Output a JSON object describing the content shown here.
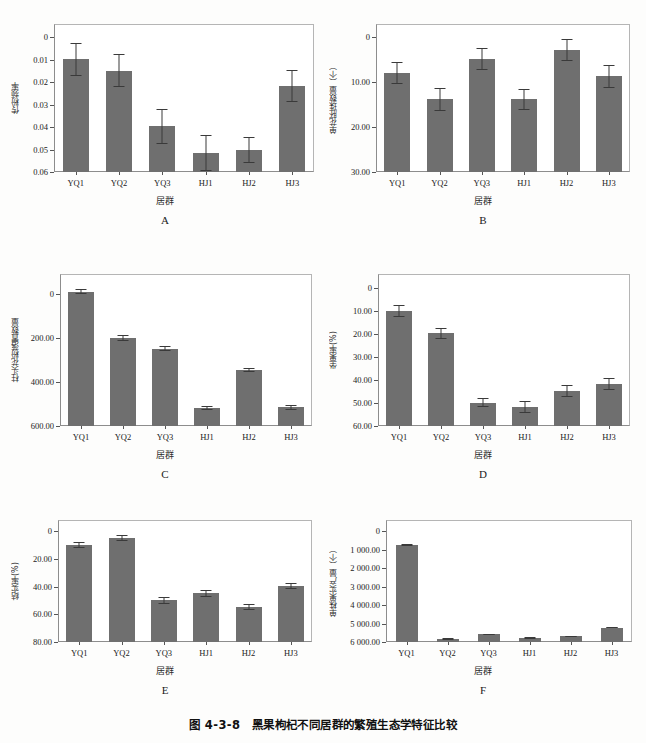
{
  "figure": {
    "caption": "图 4-3-8　黑果枸杞不同居群的繁殖生态学特征比较",
    "bar_color": "#6f6f6f",
    "error_color": "#3a3a3a",
    "frame_color": "#8d8d8d",
    "categories": [
      "YQ1",
      "YQ2",
      "YQ3",
      "HJ1",
      "HJ2",
      "HJ3"
    ],
    "xlabel": "居群"
  },
  "panels": [
    {
      "letter": "A",
      "ylabel": "传粉频率",
      "yticks": [
        "0.06",
        "0.05",
        "0.04",
        "0.03",
        "0.02",
        "0.01",
        "0"
      ]
    },
    {
      "letter": "B",
      "ylabel": "单花胚珠数量（个）",
      "yticks": [
        "30.00",
        "20.00",
        "10.00",
        "0"
      ]
    },
    {
      "letter": "C",
      "ylabel": "柱头花粉落置数量",
      "yticks": [
        "600.00",
        "400.00",
        "200.00",
        "0"
      ]
    },
    {
      "letter": "D",
      "ylabel": "坐果率(%)",
      "yticks": [
        "60.00",
        "50.00",
        "40.00",
        "30.00",
        "20.00",
        "10.00",
        "0"
      ]
    },
    {
      "letter": "E",
      "ylabel": "结实率(%)",
      "yticks": [
        "80.00",
        "60.00",
        "40.00",
        "20.00",
        "0"
      ]
    },
    {
      "letter": "F",
      "ylabel": "单株果实产量（个）",
      "yticks": [
        "6 000.00",
        "5 000.00",
        "4 000.00",
        "3 000.00",
        "2 000.00",
        "1 000.00",
        "0"
      ]
    }
  ],
  "chart_data": [
    {
      "type": "bar",
      "panel": "A",
      "title": "A",
      "xlabel": "居群",
      "ylabel": "传粉频率",
      "categories": [
        "YQ1",
        "YQ2",
        "YQ3",
        "HJ1",
        "HJ2",
        "HJ3"
      ],
      "values": [
        0.0502,
        0.0452,
        0.0204,
        0.0085,
        0.0099,
        0.0385
      ],
      "errors": [
        0.0075,
        0.0075,
        0.0077,
        0.0079,
        0.0058,
        0.0072
      ],
      "ylim": [
        0,
        0.066
      ],
      "yticks": [
        0,
        0.01,
        0.02,
        0.03,
        0.04,
        0.05,
        0.06
      ],
      "grid": false,
      "legend": "none"
    },
    {
      "type": "bar",
      "panel": "B",
      "title": "B",
      "xlabel": "居群",
      "ylabel": "单花胚珠数量（个）",
      "categories": [
        "YQ1",
        "YQ2",
        "YQ3",
        "HJ1",
        "HJ2",
        "HJ3"
      ],
      "values": [
        22.1,
        16.2,
        25.2,
        16.2,
        27.2,
        21.3
      ],
      "errors": [
        2.5,
        2.5,
        2.4,
        2.4,
        2.4,
        2.5
      ],
      "ylim": [
        0,
        33
      ],
      "yticks": [
        0,
        10,
        20,
        30
      ],
      "grid": false,
      "legend": "none"
    },
    {
      "type": "bar",
      "panel": "C",
      "title": "C",
      "xlabel": "居群",
      "ylabel": "柱头花粉落置数量",
      "categories": [
        "YQ1",
        "YQ2",
        "YQ3",
        "HJ1",
        "HJ2",
        "HJ3"
      ],
      "values": [
        610,
        400,
        351,
        82,
        254,
        84
      ],
      "errors": [
        12,
        12,
        11,
        10,
        11,
        12
      ],
      "ylim": [
        0,
        690
      ],
      "yticks": [
        0,
        200,
        400,
        600
      ],
      "grid": false,
      "legend": "none"
    },
    {
      "type": "bar",
      "panel": "D",
      "title": "D",
      "xlabel": "居群",
      "ylabel": "坐果率(%)",
      "categories": [
        "YQ1",
        "YQ2",
        "YQ3",
        "HJ1",
        "HJ2",
        "HJ3"
      ],
      "values": [
        50.1,
        40.2,
        10.2,
        8.2,
        15.1,
        18.2
      ],
      "errors": [
        2.6,
        2.5,
        2.0,
        2.6,
        2.6,
        2.5
      ],
      "ylim": [
        0,
        66
      ],
      "yticks": [
        0,
        10,
        20,
        30,
        40,
        50,
        60
      ],
      "grid": false,
      "legend": "none"
    },
    {
      "type": "bar",
      "panel": "E",
      "title": "E",
      "xlabel": "居群",
      "ylabel": "结实率(%)",
      "categories": [
        "YQ1",
        "YQ2",
        "YQ3",
        "HJ1",
        "HJ2",
        "HJ3"
      ],
      "values": [
        70.1,
        75.0,
        30.0,
        35.0,
        25.0,
        40.1
      ],
      "errors": [
        2.2,
        2.3,
        2.3,
        2.5,
        2.2,
        2.2
      ],
      "ylim": [
        0,
        88
      ],
      "yticks": [
        0,
        20,
        40,
        60,
        80
      ],
      "grid": false,
      "legend": "none"
    },
    {
      "type": "bar",
      "panel": "F",
      "title": "F",
      "xlabel": "居群",
      "ylabel": "单株果实产量（个）",
      "categories": [
        "YQ1",
        "YQ2",
        "YQ3",
        "HJ1",
        "HJ2",
        "HJ3"
      ],
      "values": [
        5250,
        160,
        420,
        215,
        320,
        775
      ],
      "errors": [
        40,
        30,
        30,
        30,
        30,
        30
      ],
      "ylim": [
        0,
        6600
      ],
      "yticks": [
        0,
        1000,
        2000,
        3000,
        4000,
        5000,
        6000
      ],
      "grid": false,
      "legend": "none"
    }
  ]
}
